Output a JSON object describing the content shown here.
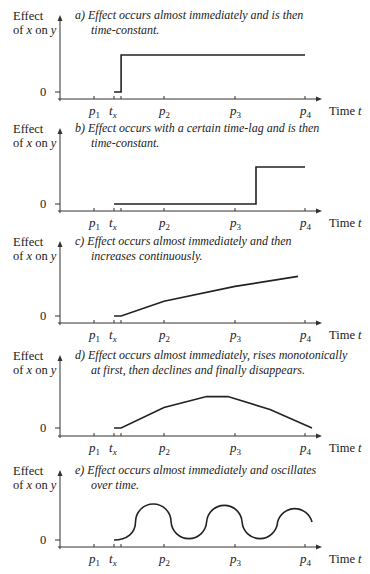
{
  "figure": {
    "y_axis_label_line1": "Effect",
    "y_axis_label_line2_prefix": "of ",
    "y_axis_label_line2_var": "x",
    "y_axis_label_line2_mid": " on ",
    "y_axis_label_line2_var2": "y",
    "zero_label": "0",
    "x_axis_label_prefix": "Time ",
    "x_axis_label_var": "t",
    "tick_labels": [
      {
        "base": "p",
        "sub": "1"
      },
      {
        "base": "t",
        "sub": "x"
      },
      {
        "base": "p",
        "sub": "2"
      },
      {
        "base": "p",
        "sub": "3"
      },
      {
        "base": "p",
        "sub": "4"
      }
    ]
  },
  "chart_data": [
    {
      "type": "line",
      "panel": "a",
      "title_line1": "a)  Effect occurs almost immediately and is then",
      "title_line2": "time-constant.",
      "xlabel": "Time t",
      "ylabel": "Effect of x on y",
      "x_ticks": [
        "p1",
        "tx",
        "p2",
        "p3",
        "p4"
      ],
      "x_tick_values": [
        1,
        1.3,
        2,
        3,
        4
      ],
      "points": [
        [
          1.3,
          0
        ],
        [
          1.4,
          0
        ],
        [
          1.4,
          1
        ],
        [
          4,
          1
        ]
      ],
      "xlim": [
        0.5,
        4.25
      ],
      "ylim": [
        0,
        1.2
      ]
    },
    {
      "type": "line",
      "panel": "b",
      "title_line1": "b)  Effect occurs with a certain time-lag and is then",
      "title_line2": "time-constant.",
      "xlabel": "Time t",
      "ylabel": "Effect of x on y",
      "x_ticks": [
        "p1",
        "tx",
        "p2",
        "p3",
        "p4"
      ],
      "x_tick_values": [
        1,
        1.3,
        2,
        3,
        4
      ],
      "points": [
        [
          1.3,
          0
        ],
        [
          3.3,
          0
        ],
        [
          3.3,
          1
        ],
        [
          4,
          1
        ]
      ],
      "xlim": [
        0.5,
        4.25
      ],
      "ylim": [
        0,
        1.2
      ]
    },
    {
      "type": "line",
      "panel": "c",
      "title_line1": "c)  Effect occurs almost immediately and then",
      "title_line2": "increases continuously.",
      "xlabel": "Time t",
      "ylabel": "Effect of x on y",
      "x_ticks": [
        "p1",
        "tx",
        "p2",
        "p3",
        "p4"
      ],
      "x_tick_values": [
        1,
        1.3,
        2,
        3,
        4
      ],
      "points": [
        [
          1.3,
          0
        ],
        [
          1.4,
          0
        ],
        [
          2,
          0.4
        ],
        [
          3,
          0.8
        ],
        [
          3.9,
          1.07
        ]
      ],
      "xlim": [
        0.5,
        4.25
      ],
      "ylim": [
        0,
        1.2
      ]
    },
    {
      "type": "line",
      "panel": "d",
      "title_line1": "d)  Effect occurs almost immediately, rises monotonically",
      "title_line2": "at first, then declines and finally disappears.",
      "xlabel": "Time t",
      "ylabel": "Effect of x on y",
      "x_ticks": [
        "p1",
        "tx",
        "p2",
        "p3",
        "p4"
      ],
      "x_tick_values": [
        1,
        1.3,
        2,
        3,
        4
      ],
      "points": [
        [
          1.3,
          0
        ],
        [
          1.4,
          0
        ],
        [
          2,
          0.55
        ],
        [
          2.6,
          0.85
        ],
        [
          2.9,
          0.85
        ],
        [
          3.5,
          0.5
        ],
        [
          4.1,
          0
        ]
      ],
      "xlim": [
        0.5,
        4.25
      ],
      "ylim": [
        0,
        1.2
      ]
    },
    {
      "type": "line",
      "panel": "e",
      "title_line1": "e)  Effect occurs almost immediately and oscillates",
      "title_line2": "over time.",
      "xlabel": "Time t",
      "ylabel": "Effect of x on y",
      "x_ticks": [
        "p1",
        "tx",
        "p2",
        "p3",
        "p4"
      ],
      "x_tick_values": [
        1,
        1.3,
        2,
        3,
        4
      ],
      "oscillation": {
        "start": 1.3,
        "end": 4.1,
        "peaks_at": [
          1.85,
          2.85,
          3.85
        ],
        "troughs_at": [
          2.35,
          3.35
        ],
        "amplitude": 1.0,
        "end_value": 0.5
      },
      "xlim": [
        0.5,
        4.25
      ],
      "ylim": [
        0,
        1.2
      ]
    }
  ]
}
